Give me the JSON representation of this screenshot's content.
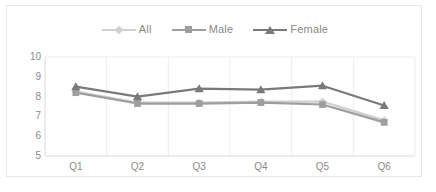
{
  "chart_data": {
    "type": "line",
    "title": "",
    "subtitle": "",
    "xlabel": "",
    "ylabel": "",
    "categories": [
      "Q1",
      "Q2",
      "Q3",
      "Q4",
      "Q5",
      "Q6"
    ],
    "ylim": [
      5,
      10
    ],
    "yticks": [
      5,
      6,
      7,
      8,
      9,
      10
    ],
    "grid": {
      "horizontal": false,
      "vertical": true
    },
    "legend_position": "top-center",
    "series": [
      {
        "name": "All",
        "marker": "diamond",
        "color": "#cfcfcf",
        "values": [
          8.25,
          7.7,
          7.7,
          7.75,
          7.75,
          6.8
        ]
      },
      {
        "name": "Male",
        "marker": "square",
        "color": "#9e9e9e",
        "values": [
          8.2,
          7.65,
          7.65,
          7.7,
          7.6,
          6.7
        ]
      },
      {
        "name": "Female",
        "marker": "triangle",
        "color": "#7a7a7a",
        "values": [
          8.5,
          8.0,
          8.4,
          8.35,
          8.55,
          7.55
        ]
      }
    ]
  },
  "legend": {
    "items": [
      {
        "label": "All"
      },
      {
        "label": "Male"
      },
      {
        "label": "Female"
      }
    ]
  },
  "axes": {
    "y_tick_labels": [
      "10",
      "9",
      "8",
      "7",
      "6",
      "5"
    ],
    "x_tick_labels": [
      "Q1",
      "Q2",
      "Q3",
      "Q4",
      "Q5",
      "Q6"
    ]
  },
  "colors": {
    "all": "#cfcfcf",
    "male": "#9e9e9e",
    "female": "#7a7a7a",
    "axis": "#d9d9d9",
    "grid": "#ededed",
    "text": "#8a8a8a",
    "border": "#e6e6e6",
    "background": "#ffffff"
  }
}
